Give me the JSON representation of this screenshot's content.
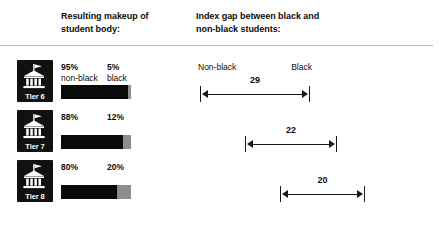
{
  "headers": {
    "makeup": "Resulting makeup of\nstudent body:",
    "gap": "Index gap between black and\nnon-black students:"
  },
  "colors": {
    "bar_nonblack": "#0a0a0a",
    "bar_black": "#8d8d8d",
    "icon_background": "#111111",
    "rule": "#b9b9b9",
    "text": "#0d0d0d"
  },
  "icon_name": "college-building-flag-icon",
  "gap_end_labels": {
    "left": "Non-black",
    "right": "Black"
  },
  "chart_data": {
    "type": "bar",
    "xlabel": "",
    "ylabel": "",
    "categories": [
      "Tier 6",
      "Tier 7",
      "Tier 8"
    ],
    "series": [
      {
        "name": "non-black",
        "values": [
          95,
          88,
          80
        ],
        "unit": "%"
      },
      {
        "name": "black",
        "values": [
          5,
          12,
          20
        ],
        "unit": "%"
      }
    ],
    "index_gap": {
      "name": "Index gap",
      "values": [
        29,
        22,
        20
      ]
    },
    "rows": [
      {
        "tier": "Tier 6",
        "nonblack_pct": "95%",
        "nonblack_label": "non-black",
        "black_pct": "5%",
        "black_label": "black",
        "nonblack_value": 95,
        "black_value": 5,
        "gap": "29",
        "gap_value": 29,
        "gap_left_px": 200,
        "gap_width_px": 110,
        "show_end_labels": true
      },
      {
        "tier": "Tier 7",
        "nonblack_pct": "88%",
        "nonblack_label": "",
        "black_pct": "12%",
        "black_label": "",
        "nonblack_value": 88,
        "black_value": 12,
        "gap": "22",
        "gap_value": 22,
        "gap_left_px": 245,
        "gap_width_px": 92,
        "show_end_labels": false
      },
      {
        "tier": "Tier 8",
        "nonblack_pct": "80%",
        "nonblack_label": "",
        "black_pct": "20%",
        "black_label": "",
        "nonblack_value": 80,
        "black_value": 20,
        "gap": "20",
        "gap_value": 20,
        "gap_left_px": 280,
        "gap_width_px": 85,
        "show_end_labels": false
      }
    ],
    "grid": false,
    "legend": "none"
  }
}
